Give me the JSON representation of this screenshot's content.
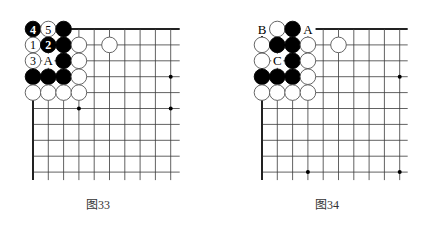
{
  "figures": [
    {
      "id": "fig33",
      "caption": "图33",
      "origin_x": 33,
      "grid": {
        "cols": 10,
        "rows": 10,
        "dx": 15.3,
        "dy": 15.9,
        "extend_right": 9,
        "extend_down": 8,
        "top_line_start_col": 2.5
      },
      "star_points": [
        [
          3,
          5
        ],
        [
          9,
          5
        ],
        [
          9,
          3
        ]
      ],
      "stones": [
        {
          "col": 0,
          "row": 0,
          "color": "black",
          "label": "4"
        },
        {
          "col": 1,
          "row": 0,
          "color": "white",
          "label": "5"
        },
        {
          "col": 2,
          "row": 0,
          "color": "black",
          "label": ""
        },
        {
          "col": 0,
          "row": 1,
          "color": "white",
          "label": "1"
        },
        {
          "col": 1,
          "row": 1,
          "color": "black",
          "label": "2"
        },
        {
          "col": 2,
          "row": 1,
          "color": "black",
          "label": ""
        },
        {
          "col": 3,
          "row": 1,
          "color": "white",
          "label": ""
        },
        {
          "col": 5,
          "row": 1,
          "color": "white",
          "label": ""
        },
        {
          "col": 0,
          "row": 2,
          "color": "white",
          "label": "3"
        },
        {
          "col": 2,
          "row": 2,
          "color": "black",
          "label": ""
        },
        {
          "col": 3,
          "row": 2,
          "color": "white",
          "label": ""
        },
        {
          "col": 0,
          "row": 3,
          "color": "black",
          "label": ""
        },
        {
          "col": 1,
          "row": 3,
          "color": "black",
          "label": ""
        },
        {
          "col": 2,
          "row": 3,
          "color": "black",
          "label": ""
        },
        {
          "col": 3,
          "row": 3,
          "color": "white",
          "label": ""
        },
        {
          "col": 0,
          "row": 4,
          "color": "white",
          "label": ""
        },
        {
          "col": 1,
          "row": 4,
          "color": "white",
          "label": ""
        },
        {
          "col": 2,
          "row": 4,
          "color": "white",
          "label": ""
        },
        {
          "col": 3,
          "row": 4,
          "color": "white",
          "label": ""
        }
      ],
      "marks": [
        {
          "col": 1,
          "row": 2,
          "label": "A"
        }
      ]
    },
    {
      "id": "fig34",
      "caption": "图34",
      "origin_x": 262,
      "grid": {
        "cols": 10,
        "rows": 10,
        "dx": 15.3,
        "dy": 15.9,
        "extend_right": 8,
        "extend_down": 8,
        "top_line_start_col": 3.5
      },
      "star_points": [
        [
          3,
          9
        ],
        [
          9,
          9
        ],
        [
          9,
          3
        ]
      ],
      "stones": [
        {
          "col": 1,
          "row": 0,
          "color": "white",
          "label": ""
        },
        {
          "col": 2,
          "row": 0,
          "color": "black",
          "label": ""
        },
        {
          "col": 0,
          "row": 1,
          "color": "white",
          "label": ""
        },
        {
          "col": 1,
          "row": 1,
          "color": "black",
          "label": ""
        },
        {
          "col": 2,
          "row": 1,
          "color": "black",
          "label": ""
        },
        {
          "col": 3,
          "row": 1,
          "color": "white",
          "label": ""
        },
        {
          "col": 5,
          "row": 1,
          "color": "white",
          "label": ""
        },
        {
          "col": 0,
          "row": 2,
          "color": "white",
          "label": ""
        },
        {
          "col": 2,
          "row": 2,
          "color": "black",
          "label": ""
        },
        {
          "col": 3,
          "row": 2,
          "color": "white",
          "label": ""
        },
        {
          "col": 0,
          "row": 3,
          "color": "black",
          "label": ""
        },
        {
          "col": 1,
          "row": 3,
          "color": "black",
          "label": ""
        },
        {
          "col": 2,
          "row": 3,
          "color": "black",
          "label": ""
        },
        {
          "col": 3,
          "row": 3,
          "color": "white",
          "label": ""
        },
        {
          "col": 0,
          "row": 4,
          "color": "white",
          "label": ""
        },
        {
          "col": 1,
          "row": 4,
          "color": "white",
          "label": ""
        },
        {
          "col": 2,
          "row": 4,
          "color": "white",
          "label": ""
        },
        {
          "col": 3,
          "row": 4,
          "color": "white",
          "label": ""
        }
      ],
      "marks": [
        {
          "col": 0,
          "row": 0,
          "label": "B"
        },
        {
          "col": 3,
          "row": 0,
          "label": "A"
        },
        {
          "col": 1,
          "row": 2,
          "label": "C"
        }
      ]
    }
  ],
  "colors": {
    "line": "#3a3a3a",
    "edge": "#222222",
    "black_stone": "#000000",
    "white_stone": "#ffffff",
    "stone_outline": "#555555"
  }
}
